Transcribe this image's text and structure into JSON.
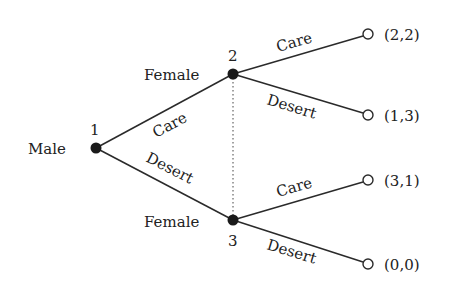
{
  "diagram": {
    "type": "extensive-form game tree",
    "colors": {
      "line": "#2a2a2a",
      "decision_node": "#1a1a1a",
      "terminal_fill": "#ffffff",
      "background": "#ffffff"
    },
    "nodes": [
      {
        "id": "1",
        "player": "Male",
        "number_label": "1"
      },
      {
        "id": "2",
        "player": "Female",
        "number_label": "2"
      },
      {
        "id": "3",
        "player": "Female",
        "number_label": "3"
      }
    ],
    "edges": [
      {
        "from": "1",
        "to": "2",
        "label": "Care"
      },
      {
        "from": "1",
        "to": "3",
        "label": "Desert"
      },
      {
        "from": "2",
        "to": "t1",
        "label": "Care"
      },
      {
        "from": "2",
        "to": "t2",
        "label": "Desert"
      },
      {
        "from": "3",
        "to": "t3",
        "label": "Care"
      },
      {
        "from": "3",
        "to": "t4",
        "label": "Desert"
      }
    ],
    "information_set": {
      "nodes": [
        "2",
        "3"
      ],
      "style": "dotted"
    },
    "terminals": [
      {
        "id": "t1",
        "payoff": "(2,2)"
      },
      {
        "id": "t2",
        "payoff": "(1,3)"
      },
      {
        "id": "t3",
        "payoff": "(3,1)"
      },
      {
        "id": "t4",
        "payoff": "(0,0)"
      }
    ]
  }
}
